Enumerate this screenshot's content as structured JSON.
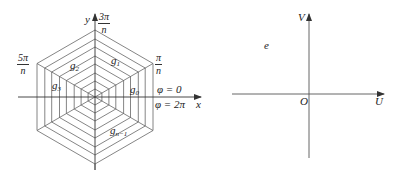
{
  "left_diagram": {
    "title": "Hexagonal sector partition",
    "axes": {
      "x_label": "x",
      "y_label": "y"
    },
    "angle_labels": {
      "top": {
        "numerator": "3π",
        "denominator": "n"
      },
      "upper_left": {
        "numerator": "5π",
        "denominator": "n"
      },
      "upper_right": {
        "numerator": "π",
        "denominator": "n"
      },
      "phi_start": "φ = 0",
      "phi_end": "φ = 2π"
    },
    "sector_labels": [
      {
        "base": "g",
        "sub": "0"
      },
      {
        "base": "g",
        "sub": "1"
      },
      {
        "base": "g",
        "sub": "2"
      },
      {
        "base": "g",
        "sub": "3"
      },
      {
        "base": "g",
        "sub": "n−1"
      }
    ],
    "rings": 8,
    "sides": 6
  },
  "right_diagram": {
    "axes": {
      "x_label": "U",
      "y_label": "V",
      "origin_label": "O"
    },
    "region_label": "e"
  },
  "colors": {
    "line": "#555555",
    "text": "#222222",
    "background": "#ffffff"
  }
}
